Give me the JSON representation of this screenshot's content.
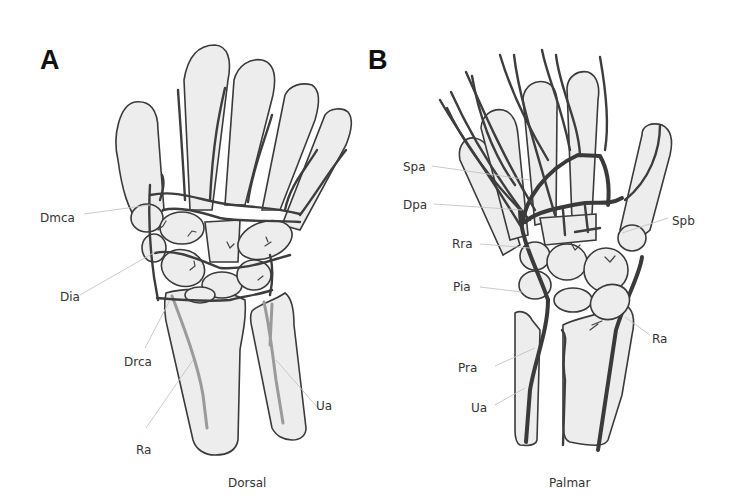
{
  "figure": {
    "panels": [
      {
        "id": "A",
        "letter": "A",
        "caption": "Dorsal",
        "labels": {
          "dmca": "Dmca",
          "dia": "Dia",
          "drca": "Drca",
          "ra": "Ra",
          "ua": "Ua"
        }
      },
      {
        "id": "B",
        "letter": "B",
        "caption": "Palmar",
        "labels": {
          "spa": "Spa",
          "dpa": "Dpa",
          "rra": "Rra",
          "pia": "Pia",
          "pra": "Pra",
          "ua": "Ua",
          "spb": "Spb",
          "ra": "Ra"
        }
      }
    ],
    "colors": {
      "bone_fill": "#ededed",
      "outline": "#3a3a3a",
      "vessel": "#3d3d3d",
      "deep_vessel": "#9a9a9a",
      "leader_line": "#c4c4c4"
    }
  }
}
